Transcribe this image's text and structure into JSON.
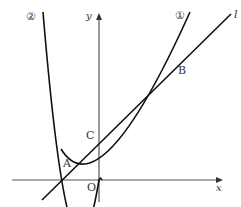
{
  "figure": {
    "axes": {
      "x_label": "x",
      "y_label": "y",
      "origin_label": "O",
      "color": "#555555"
    },
    "curves": [
      {
        "id": "curve-1",
        "label": "①",
        "type": "parabola",
        "vertex": "O",
        "opening": "up",
        "width": "narrower-right",
        "color": "#111111"
      },
      {
        "id": "curve-2",
        "label": "②",
        "type": "parabola",
        "vertex": "O",
        "opening": "up",
        "width": "steeper",
        "color": "#111111"
      }
    ],
    "line": {
      "id": "line-l",
      "label": "l",
      "color": "#111111"
    },
    "points": {
      "A": "A",
      "B": "B",
      "C": "C"
    }
  }
}
